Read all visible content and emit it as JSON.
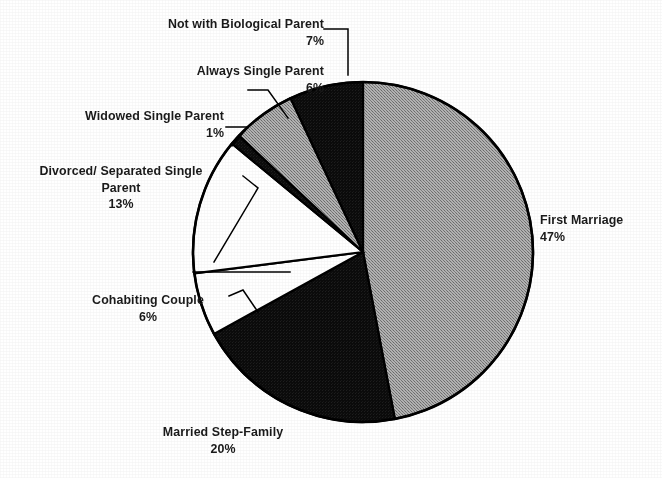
{
  "chart_data": {
    "type": "pie",
    "title": "",
    "subtitle": "",
    "xlabel": "",
    "ylabel": "",
    "legend_position": "none",
    "grid": false,
    "labels_outside": true,
    "start_angle_deg": 0,
    "direction": "clockwise",
    "categories": [
      "First Marriage",
      "Married Step-Family",
      "Cohabiting Couple",
      "Divorced/ Separated Single Parent",
      "Widowed Single Parent",
      "Always Single Parent",
      "Not with Biological Parent"
    ],
    "values": [
      47,
      20,
      6,
      13,
      1,
      6,
      7
    ],
    "value_suffix": "%",
    "slices": [
      {
        "name": "First Marriage",
        "label_lines": [
          "First Marriage"
        ],
        "value": 47,
        "value_text": "47%",
        "fill": "gray",
        "fill_hex": "#9a9a9a",
        "start_deg": 0,
        "end_deg": 169.2,
        "has_leader_line": false
      },
      {
        "name": "Married Step-Family",
        "label_lines": [
          "Married Step-Family"
        ],
        "value": 20,
        "value_text": "20%",
        "fill": "black",
        "fill_hex": "#0d0d0d",
        "start_deg": 169.2,
        "end_deg": 241.2,
        "has_leader_line": false
      },
      {
        "name": "Cohabiting Couple",
        "label_lines": [
          "Cohabiting Couple"
        ],
        "value": 6,
        "value_text": "6%",
        "fill": "white",
        "fill_hex": "#ffffff",
        "start_deg": 241.2,
        "end_deg": 262.8,
        "has_leader_line": true
      },
      {
        "name": "Divorced/ Separated Single Parent",
        "label_lines": [
          "Divorced/ Separated Single",
          "Parent"
        ],
        "value": 13,
        "value_text": "13%",
        "fill": "white",
        "fill_hex": "#ffffff",
        "start_deg": 262.8,
        "end_deg": 309.6,
        "has_leader_line": true
      },
      {
        "name": "Widowed Single Parent",
        "label_lines": [
          "Widowed Single Parent"
        ],
        "value": 1,
        "value_text": "1%",
        "fill": "black",
        "fill_hex": "#0d0d0d",
        "start_deg": 309.6,
        "end_deg": 313.2,
        "has_leader_line": true
      },
      {
        "name": "Always Single Parent",
        "label_lines": [
          "Always Single Parent"
        ],
        "value": 6,
        "value_text": "6%",
        "fill": "gray",
        "fill_hex": "#9a9a9a",
        "start_deg": 313.2,
        "end_deg": 334.8,
        "has_leader_line": true
      },
      {
        "name": "Not with Biological Parent",
        "label_lines": [
          "Not with Biological Parent"
        ],
        "value": 7,
        "value_text": "7%",
        "fill": "black",
        "fill_hex": "#0d0d0d",
        "start_deg": 334.8,
        "end_deg": 360,
        "has_leader_line": true
      }
    ],
    "colors": {
      "gray": "#9a9a9a",
      "black": "#0d0d0d",
      "white": "#ffffff",
      "outline": "#000000",
      "background": "#ffffff",
      "text": "#1a1a1a"
    }
  }
}
